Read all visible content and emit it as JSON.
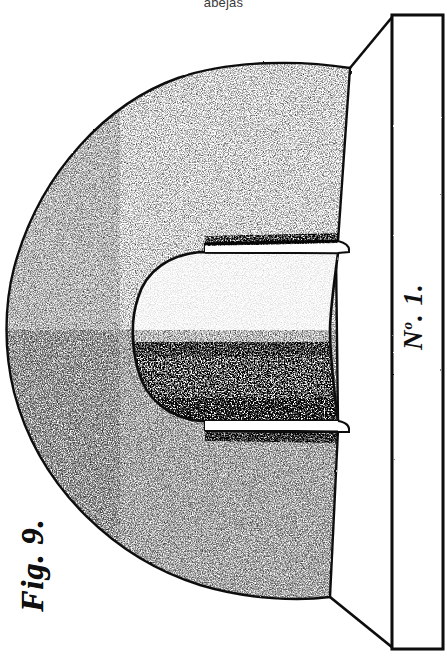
{
  "page": {
    "background_color": "#ffffff",
    "ink_color": "#101010",
    "header_text": "abejas"
  },
  "figure": {
    "fig_label": "Fig. 9.",
    "bar_label_prefix": "N",
    "bar_label_sup": "o",
    "bar_label_suffix": ". 1.",
    "bar_label_full": "No. 1.",
    "parts": [
      {
        "name": "outer-body",
        "label": "C-shaped stippled body"
      },
      {
        "name": "inner-cavity",
        "label": "rounded inner recess"
      },
      {
        "name": "upper-slot",
        "label": "upper horizontal groove"
      },
      {
        "name": "lower-slot",
        "label": "lower horizontal groove"
      },
      {
        "name": "vertical-bar",
        "label": "vertical rectangular bar No. 1."
      },
      {
        "name": "upper-diagonal",
        "label": "upper connecting edge"
      },
      {
        "name": "lower-diagonal",
        "label": "lower connecting edge"
      }
    ]
  }
}
